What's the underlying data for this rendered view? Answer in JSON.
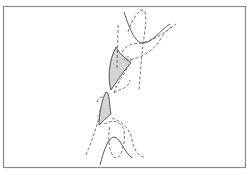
{
  "figure": {
    "frame": {
      "x": 3,
      "y": 6,
      "width": 242,
      "height": 161,
      "stroke": "#8a8a8a"
    },
    "colors": {
      "line": "#555555",
      "dashed": "#666666",
      "fill": "#d4d4d4"
    },
    "solid_curves": [
      "M124,12 C130,30 135,42 142,43 C152,44 160,30 170,24",
      "M100,165 C104,150 108,138 114,137 C120,137 124,152 132,158"
    ],
    "dashed_curves": [
      "M118,25 C118,40 117,55 117,70",
      "M128,32 C132,20 138,10 143,10 C148,12 145,30 143,45 C141,60 140,80 139,90",
      "M122,52 C130,40 140,45 145,42 C158,38 168,30 176,24",
      "M126,60 C135,60 150,55 160,40 C166,30 170,28 172,26",
      "M114,93 C118,80 128,70 130,62 C132,56 126,55 124,60",
      "M114,93 C120,88 128,90 130,80",
      "M97,102 C99,97 102,96 104,98",
      "M86,155 C92,140 98,125 100,110",
      "M104,124 C112,120 120,120 124,130 C126,145 120,162 114,157 C108,150 108,135 110,126",
      "M112,118 C122,122 130,128 132,140 C134,150 138,156 144,157"
    ],
    "shaded_regions": [
      "M116,47 C120,55 126,58 131,63 C124,70 118,80 111,90 C108,80 108,62 116,47 Z",
      "M106,92 C110,92 109,105 111,114 C106,118 102,122 99,125 C99,115 102,98 106,92 Z"
    ]
  }
}
